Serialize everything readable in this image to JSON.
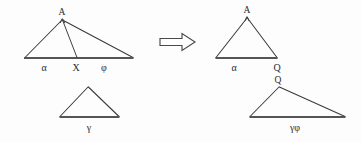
{
  "figure": {
    "background_color": "#fdfdfd",
    "stroke_color": "#3a3a3a",
    "label_color": "#2b2b2b",
    "transform_icon": "right-block-arrow-icon"
  },
  "left_group": {
    "big_triangle": {
      "name": "subdivided-triangle",
      "apex_label": "A",
      "base_left_label": "α",
      "base_mid_label": "X",
      "base_right_label": "φ",
      "vertices": {
        "apex": [
          62,
          19
        ],
        "left": [
          25,
          58
        ],
        "right": [
          133,
          58
        ]
      },
      "cevian_foot": [
        77,
        58
      ]
    },
    "small_triangle": {
      "name": "gamma-triangle",
      "base_label": "γ",
      "vertices": {
        "apex": [
          88,
          87
        ],
        "left": [
          60,
          117
        ],
        "right": [
          119,
          117
        ]
      }
    }
  },
  "right_group": {
    "top_triangle": {
      "name": "alpha-q-triangle",
      "apex_label": "A",
      "base_left_label": "α",
      "base_right_label": "Q",
      "vertices": {
        "apex": [
          247,
          17
        ],
        "left": [
          216,
          58
        ],
        "right": [
          277,
          58
        ]
      }
    },
    "bottom_triangle": {
      "name": "gamma-phi-triangle",
      "apex_label": "Q",
      "base_label": "γφ",
      "vertices": {
        "apex": [
          279,
          87
        ],
        "left": [
          250,
          117
        ],
        "right": [
          345,
          117
        ]
      }
    }
  },
  "labels": {
    "left_big_apex": "A",
    "left_big_alpha": "α",
    "left_big_x": "X",
    "left_big_phi": "φ",
    "left_small_gamma": "γ",
    "right_top_apex": "A",
    "right_top_alpha": "α",
    "right_top_q": "Q",
    "right_bottom_q": "Q",
    "right_bottom_gammaphi": "γφ"
  }
}
